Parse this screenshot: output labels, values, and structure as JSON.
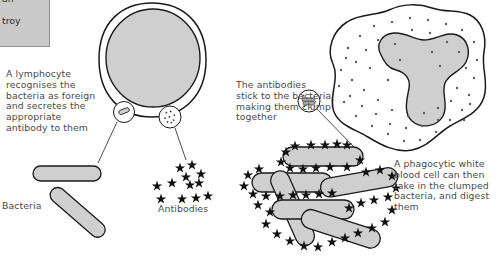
{
  "diagram": {
    "colors": {
      "cell_fill": "#cfcfcf",
      "outline": "#1a1a1a",
      "text": "#4a4a4a",
      "box_fill": "#c9c9c9",
      "page_background": "#ffffff"
    }
  },
  "clipped_box": {
    "line1": "an",
    "line2": "troy"
  },
  "captions": {
    "lymphocyte": "A lymphocyte\nrecognises the\nbacteria as foreign\nand secretes the\nappropriate\nantibody to them",
    "bacteria_label": "Bacteria",
    "antibodies_label": "Antibodies",
    "clumping": "The antibodies\nstick to the bacteria\nmaking them clump\ntogether",
    "phagocyte": "A phagocytic white\nblood cell can then\ntake in the clumped\nbacteria, and digest\nthem"
  },
  "elements": {
    "lymphocyte_cell": "lymphocyte-cell",
    "lymphocyte_nucleus": "lymphocyte-nucleus",
    "callout_bacterium": "callout-bacterium-icon",
    "callout_antibody": "callout-antibody-icon",
    "callout_clump": "callout-clumped-bacteria-icon",
    "phagocyte_cell": "phagocyte-cell",
    "phagocyte_nucleus": "phagocyte-nucleus",
    "free_bacteria_count": 2,
    "free_antibodies_count": 12,
    "clumped_bacteria_count": 6
  }
}
